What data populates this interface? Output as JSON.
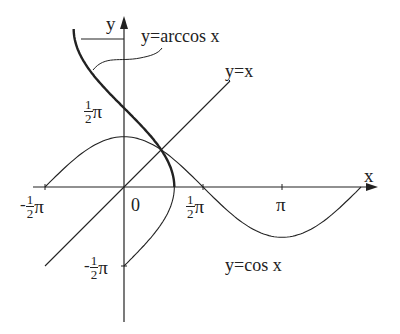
{
  "labels": {
    "y_axis": "y",
    "x_axis": "x",
    "arccos": "y=arccos x",
    "identity": "y=x",
    "cos": "y=cos x",
    "origin": "0",
    "pi": "π",
    "neg": "-",
    "one": "1",
    "two": "2"
  },
  "chart_data": {
    "type": "line",
    "title": "",
    "xlabel": "x",
    "ylabel": "y",
    "series": [
      {
        "name": "y=arccos x",
        "domain": [
          -1,
          1
        ],
        "range": [
          0,
          3.1416
        ]
      },
      {
        "name": "y=x",
        "x": [
          -1.571,
          3.3
        ],
        "y": [
          -1.571,
          3.3
        ]
      },
      {
        "name": "y=cos x",
        "domain": [
          -1.571,
          4.712
        ]
      }
    ],
    "x_ticks": [
      "-1/2 π",
      "0",
      "1/2 π",
      "π"
    ],
    "y_ticks": [
      "1/2 π",
      "-1/2 π"
    ]
  }
}
